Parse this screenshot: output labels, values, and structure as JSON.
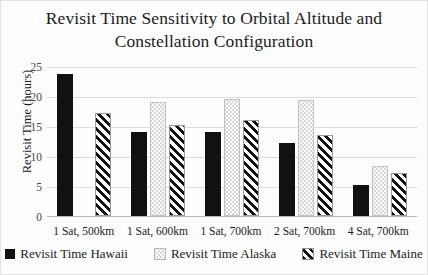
{
  "chart_data": {
    "type": "bar",
    "title": "Revisit Time Sensitivity to Orbital Altitude and Constellation Configuration",
    "title_line1": "Revisit Time Sensitivity to Orbital Altitude and",
    "title_line2": "Constellation Configuration",
    "xlabel": "",
    "ylabel": "Revisit Time (hours)",
    "ylim": [
      0,
      25
    ],
    "ytick_step": 5,
    "yticks": [
      "25",
      "20",
      "15",
      "10",
      "5",
      "0"
    ],
    "grid": true,
    "legend_position": "bottom",
    "categories": [
      "1 Sat, 500km",
      "1 Sat, 600km",
      "1 Sat, 700km",
      "2 Sat, 700km",
      "4 Sat, 700km"
    ],
    "series": [
      {
        "name": "Revisit Time Hawaii",
        "pattern": "solid-black",
        "color": "#111111",
        "values": [
          23.7,
          14.0,
          14.0,
          12.2,
          5.2
        ]
      },
      {
        "name": "Revisit Time Alaska",
        "pattern": "light-gray-dotted",
        "color": "#d6d6d6",
        "values": [
          null,
          19.0,
          19.5,
          19.3,
          8.3
        ]
      },
      {
        "name": "Revisit Time Maine",
        "pattern": "diagonal-hatch",
        "color": "#ffffff",
        "values": [
          17.1,
          15.2,
          16.0,
          13.5,
          7.2
        ]
      }
    ]
  }
}
